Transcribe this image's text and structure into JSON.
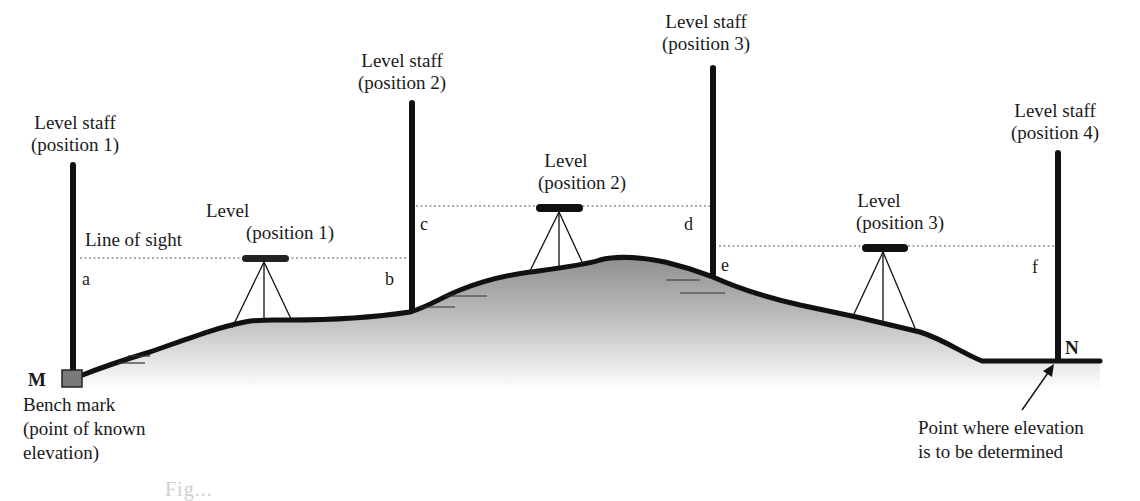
{
  "figure": {
    "staffs": [
      {
        "label_line1": "Level staff",
        "label_line2": "(position 1)",
        "reading_back": "a"
      },
      {
        "label_line1": "Level staff",
        "label_line2": "(position 2)",
        "reading_fore": "b",
        "reading_back": "c"
      },
      {
        "label_line1": "Level staff",
        "label_line2": "(position 3)",
        "reading_fore": "d",
        "reading_back": "e"
      },
      {
        "label_line1": "Level staff",
        "label_line2": "(position 4)",
        "reading_fore": "f"
      }
    ],
    "levels": [
      {
        "label_line1": "Level",
        "label_line2": "(position 1)"
      },
      {
        "label_line1": "Level",
        "label_line2": "(position 2)"
      },
      {
        "label_line1": "Level",
        "label_line2": "(position 3)"
      }
    ],
    "line_of_sight_label": "Line of sight",
    "points": {
      "start": {
        "letter": "M",
        "line1": "Bench mark",
        "line2": "(point of known",
        "line3": "elevation)"
      },
      "end": {
        "letter": "N",
        "line1": "Point where elevation",
        "line2": "is to be determined"
      }
    },
    "caption_partial": "Fig..."
  },
  "colors": {
    "ink": "#111111",
    "ground_fill_top": "#9a9a9a",
    "ground_fill_bottom": "#ffffff",
    "bench_mark": "#7a7a7a",
    "sight_line": "#555555"
  }
}
